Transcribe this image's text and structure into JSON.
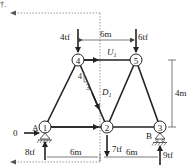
{
  "figure": {
    "type": "truss-section-diagram",
    "corner_label": "†.",
    "nodes": [
      {
        "id": "1",
        "label": "1",
        "x": 45,
        "y": 127,
        "support_label": "A"
      },
      {
        "id": "2",
        "label": "2",
        "x": 107,
        "y": 127
      },
      {
        "id": "3",
        "label": "3",
        "x": 160,
        "y": 127,
        "support_label": "B"
      },
      {
        "id": "4",
        "label": "4",
        "x": 78,
        "y": 60
      },
      {
        "id": "5",
        "label": "5",
        "x": 136,
        "y": 60
      }
    ],
    "members": [
      {
        "from": "1",
        "to": "4"
      },
      {
        "from": "4",
        "to": "5"
      },
      {
        "from": "4",
        "to": "2"
      },
      {
        "from": "2",
        "to": "5"
      },
      {
        "from": "5",
        "to": "3"
      },
      {
        "from": "1",
        "to": "2"
      },
      {
        "from": "2",
        "to": "3"
      }
    ],
    "loads": [
      {
        "label": "4tf",
        "node": "4",
        "direction": "down"
      },
      {
        "label": "6tf",
        "node": "5",
        "direction": "down"
      },
      {
        "label": "7tf",
        "node": "2",
        "direction": "down"
      }
    ],
    "reactions": [
      {
        "label": "8tf",
        "node": "1",
        "direction": "up"
      },
      {
        "label": "9tf",
        "node": "3",
        "direction": "up"
      },
      {
        "label": "0",
        "node": "1",
        "direction": "right"
      }
    ],
    "member_forces": {
      "upper": "U",
      "upper_sub": "1",
      "diagonal": "D",
      "diagonal_sub": "1"
    },
    "slope": {
      "rise": "4",
      "run": "3"
    },
    "dimensions": {
      "top_span": "6m",
      "height": "4m",
      "bottom_left": "6m",
      "bottom_right": "6m"
    }
  }
}
